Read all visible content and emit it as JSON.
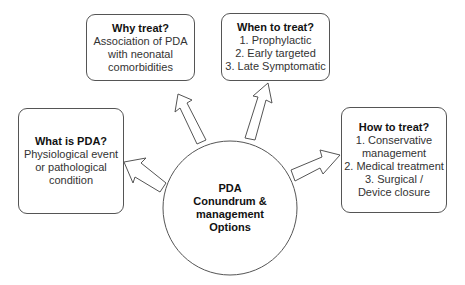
{
  "center": {
    "lines": [
      "PDA",
      "Conundrum &",
      "management",
      "Options"
    ]
  },
  "boxes": {
    "why": {
      "title": "Why treat?",
      "lines": [
        "Association of PDA",
        "with neonatal",
        "comorbidities"
      ]
    },
    "when": {
      "title": "When to treat?",
      "lines": [
        "1. Prophylactic",
        "2.  Early targeted",
        "3.  Late Symptomatic"
      ]
    },
    "what": {
      "title": "What is PDA?",
      "lines": [
        "Physiological event",
        "or pathological",
        "condition"
      ]
    },
    "how": {
      "title": "How to treat?",
      "lines": [
        "1. Conservative",
        "management",
        "2.  Medical treatment",
        "3.  Surgical /",
        "Device closure"
      ]
    }
  }
}
